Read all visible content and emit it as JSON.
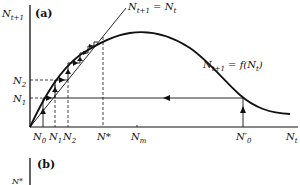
{
  "figure": {
    "panel_a": {
      "label": "(a)",
      "y_axis_label": "N_{t+1}",
      "x_axis_label": "N_t",
      "identity_line_label": "N_{t+1} = N_t",
      "curve_label": "N_{t+1} = f(N_t)",
      "x_ticks": [
        "N_0",
        "N_1",
        "N_2",
        "N*",
        "N_m",
        "N'_0"
      ],
      "y_ticks": [
        "N_2",
        "N_1"
      ]
    },
    "panel_b": {
      "label": "(b)",
      "y_axis_label": "N*"
    }
  },
  "text": {
    "a_label": "(a)",
    "b_label": "(b)",
    "ylab_main": "N",
    "ylab_sub": "t+1",
    "xlab_main": "N",
    "xlab_sub": "t",
    "identity_main": "N",
    "identity_sub": "t+1",
    "identity_eq": " = N",
    "identity_sub2": "t",
    "curve_main": "N",
    "curve_sub": "t+1",
    "curve_eq": " = f(N",
    "curve_sub2": "t",
    "curve_close": ")",
    "n2_main": "N",
    "n2_sub": "2",
    "n1_main": "N",
    "n1_sub": "1",
    "x_n0": "N",
    "x_n0_sub": "0",
    "x_n1": "N",
    "x_n1_sub": "1",
    "x_n2": "N",
    "x_n2_sub": "2",
    "x_nstar": "N*",
    "x_nm": "N",
    "x_nm_sub": "m",
    "x_n0p": "N′",
    "x_n0p_sub": "0",
    "b_ylab": "N*"
  }
}
